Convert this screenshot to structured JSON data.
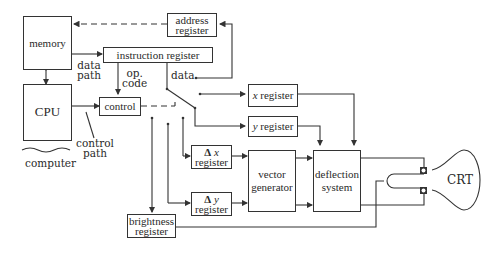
{
  "diagram": {
    "blocks": {
      "memory": "memory",
      "cpu": "CPU",
      "address_register": [
        "address",
        "register"
      ],
      "instruction_register": "instruction register",
      "control": "control",
      "x_register": {
        "var": "x",
        "label": "register"
      },
      "y_register": {
        "var": "y",
        "label": "register"
      },
      "dx_register": {
        "delta": "Δ",
        "var": "x",
        "label": "register"
      },
      "dy_register": {
        "delta": "Δ",
        "var": "y",
        "label": "register"
      },
      "vector_generator": [
        "vector",
        "generator"
      ],
      "deflection_system": [
        "deflection",
        "system"
      ],
      "brightness_register": [
        "brightness",
        "register"
      ],
      "crt": "CRT"
    },
    "labels": {
      "data_path": [
        "data",
        "path"
      ],
      "op_code": [
        "op.",
        "code"
      ],
      "data": "data",
      "control_path": [
        "control",
        "path"
      ],
      "computer": "computer"
    },
    "colors": {
      "line": "#333333",
      "text": "#2a2a2a",
      "background": "#ffffff"
    }
  }
}
